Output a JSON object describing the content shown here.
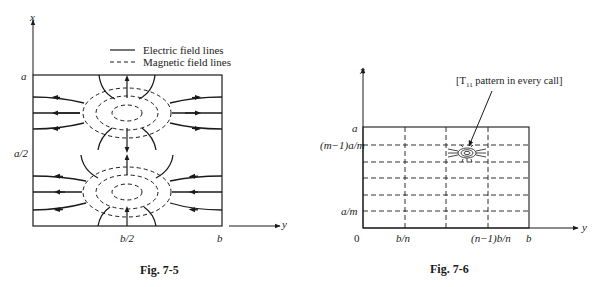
{
  "figures": [
    {
      "id": "fig-7-5",
      "caption": "Fig. 7-5",
      "axes": {
        "x_label": "x",
        "y_label": "y"
      },
      "x_ticks": [
        "a",
        "a/2"
      ],
      "y_ticks": [
        "b/2",
        "b"
      ],
      "legend": [
        {
          "style": "solid",
          "label": "Electric field lines"
        },
        {
          "style": "dashed",
          "label": "Magnetic field lines"
        }
      ],
      "description": "Rectangular waveguide cross-section showing two field-pattern cells stacked vertically, each with concentric dashed magnetic loops and solid electric field lines with arrows radiating horizontally."
    },
    {
      "id": "fig-7-6",
      "caption": "Fig. 7-6",
      "axes": {
        "x_label": "x",
        "y_label": "y"
      },
      "origin_label": "0",
      "x_ticks": [
        "a",
        "(m−1)a/m",
        "a/m"
      ],
      "y_ticks": [
        "b/n",
        "(n−1)b/n",
        "b"
      ],
      "annotation": {
        "prefix": "[T",
        "subscript": "11",
        "suffix": " pattern in every call]"
      },
      "description": "Rectangle subdivided by dashed lines into a grid of cells; one cell contains a small T11 field pattern with an arrow pointing to it from the annotation."
    }
  ]
}
